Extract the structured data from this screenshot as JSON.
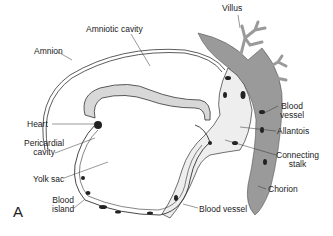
{
  "figure": {
    "panel_letter": "A",
    "labels": {
      "villus": "Villus",
      "amniotic_cavity": "Amniotic cavity",
      "amnion": "Amnion",
      "blood_vessel_upper_1": "Blood",
      "blood_vessel_upper_2": "vessel",
      "heart": "Heart",
      "allantois": "Allantois",
      "pericardial_cavity_1": "Pericardial",
      "pericardial_cavity_2": "cavity",
      "connecting_stalk_1": "Connecting",
      "connecting_stalk_2": "stalk",
      "yolk_sac": "Yolk sac",
      "chorion": "Chorion",
      "blood_island_1": "Blood",
      "blood_island_2": "island",
      "blood_vessel_lower": "Blood vessel"
    },
    "colors": {
      "chorion_fill": "#9a9a9a",
      "embryo_fill": "#d8d8d8",
      "stalk_fill": "#eeeeee",
      "line": "#333333",
      "vessel": "#222222"
    }
  }
}
